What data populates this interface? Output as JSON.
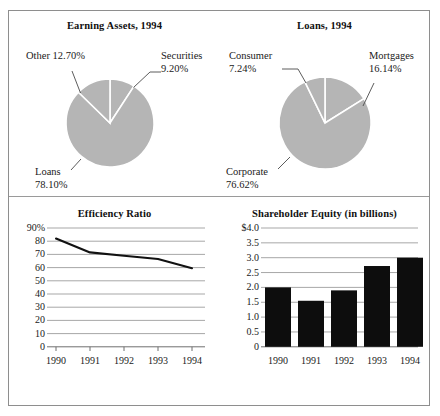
{
  "document": {
    "title": "Financial Performance Charts"
  },
  "charts": {
    "earning_assets": {
      "title": "Earning Assets, 1994",
      "labels": {
        "other": "Other 12.70%",
        "securities_name": "Securities",
        "securities_value": "9.20%",
        "loans_name": "Loans",
        "loans_value": "78.10%"
      }
    },
    "loans": {
      "title": "Loans, 1994",
      "labels": {
        "consumer_name": "Consumer",
        "consumer_value": "7.24%",
        "mortgages_name": "Mortgages",
        "mortgages_value": "16.14%",
        "corporate_name": "Corporate",
        "corporate_value": "76.62%"
      }
    },
    "efficiency": {
      "title": "Efficiency Ratio"
    },
    "equity": {
      "title": "Shareholder Equity (in billions)"
    }
  },
  "chart_data": [
    {
      "type": "pie",
      "title": "Earning Assets, 1994",
      "legend_position": "callout-labels",
      "slices": [
        {
          "label": "Securities",
          "value": 9.2,
          "display": "9.20%",
          "color": "#b5b5b5"
        },
        {
          "label": "Loans",
          "value": 78.1,
          "display": "78.10%",
          "color": "#b5b5b5"
        },
        {
          "label": "Other",
          "value": 12.7,
          "display": "12.70%",
          "color": "#b5b5b5"
        }
      ],
      "separator_color": "#ffffff",
      "units": "percent"
    },
    {
      "type": "pie",
      "title": "Loans, 1994",
      "legend_position": "callout-labels",
      "slices": [
        {
          "label": "Mortgages",
          "value": 16.14,
          "display": "16.14%",
          "color": "#b5b5b5"
        },
        {
          "label": "Corporate",
          "value": 76.62,
          "display": "76.62%",
          "color": "#b5b5b5"
        },
        {
          "label": "Consumer",
          "value": 7.24,
          "display": "7.24%",
          "color": "#b5b5b5"
        }
      ],
      "separator_color": "#ffffff",
      "units": "percent"
    },
    {
      "type": "line",
      "title": "Efficiency Ratio",
      "xlabel": "",
      "ylabel": "",
      "categories": [
        "1990",
        "1991",
        "1992",
        "1993",
        "1994"
      ],
      "values": [
        82,
        71.5,
        69,
        66.5,
        59.5
      ],
      "ylim": [
        0,
        90
      ],
      "yticks": [
        0,
        10,
        20,
        30,
        40,
        50,
        60,
        70,
        80,
        90
      ],
      "ytick_labels": [
        "0",
        "10",
        "20",
        "30",
        "40",
        "50",
        "60",
        "70",
        "80",
        "90%"
      ],
      "grid": true,
      "line_color": "#000000",
      "series": [
        {
          "name": "Efficiency Ratio",
          "values": [
            82,
            71.5,
            69,
            66.5,
            59.5
          ]
        }
      ]
    },
    {
      "type": "bar",
      "title": "Shareholder Equity (in billions)",
      "xlabel": "",
      "ylabel": "",
      "categories": [
        "1990",
        "1991",
        "1992",
        "1993",
        "1994"
      ],
      "values": [
        2.0,
        1.55,
        1.9,
        2.72,
        3.0
      ],
      "ylim": [
        0,
        4.0
      ],
      "yticks": [
        0,
        0.5,
        1.0,
        1.5,
        2.0,
        2.5,
        3.0,
        3.5,
        4.0
      ],
      "ytick_labels": [
        "0",
        "0.5",
        "1.0",
        "1.5",
        "2.0",
        "2.5",
        "3.0",
        "3.5",
        "$4.0"
      ],
      "grid": true,
      "bar_color": "#0d0d0d",
      "units": "billions of dollars"
    }
  ]
}
